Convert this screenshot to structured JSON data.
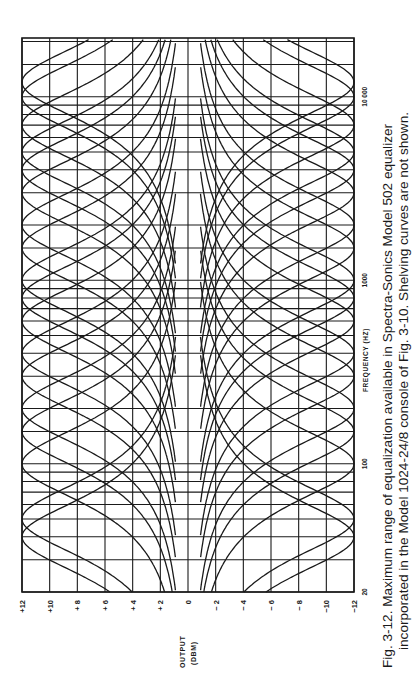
{
  "figure": {
    "caption_line1": "Fig. 3-12. Maximum range of equalization available in Spectra-Sonics Model 502 equalizer",
    "caption_line2": "incorporated in the Model 1024-24/8 console of Fig. 3-10. Shelving curves are not shown."
  },
  "colors": {
    "ink": "#1a1a1a",
    "paper": "#ffffff"
  },
  "chart_data": {
    "type": "line",
    "title": "Maximum range of equalization available in Spectra-Sonics Model 502 equalizer",
    "xlabel": "FREQUENCY (HZ)",
    "ylabel": "OUTPUT (DBM)",
    "ylabel_line1": "OUTPUT",
    "ylabel_line2": "(DBM)",
    "xscale": "log",
    "xlim": [
      20,
      20000
    ],
    "ylim": [
      -12,
      12
    ],
    "x_ticks": [
      20,
      100,
      1000,
      10000
    ],
    "x_tick_labels": [
      "20",
      "100",
      "1000",
      "10 000"
    ],
    "y_ticks": [
      12,
      10,
      8,
      6,
      4,
      2,
      0,
      -2,
      -4,
      -6,
      -8,
      -10,
      -12
    ],
    "y_tick_labels": [
      "+12",
      "+10",
      "+ 8",
      "+ 6",
      "+ 4",
      "+ 2",
      "0",
      "− 2",
      "− 4",
      "− 6",
      "− 8",
      "−10",
      "−12"
    ],
    "grid": true,
    "legend": "none",
    "orientation": "rotated 90° (frequency axis vertical, dB axis horizontal)",
    "series": [
      {
        "name": "boost/cut 40 Hz",
        "center_hz": 40,
        "peak_db": 12
      },
      {
        "name": "boost/cut 50 Hz",
        "center_hz": 50,
        "peak_db": 12
      },
      {
        "name": "boost/cut 100 Hz",
        "center_hz": 100,
        "peak_db": 12
      },
      {
        "name": "boost/cut 150 Hz",
        "center_hz": 150,
        "peak_db": 12
      },
      {
        "name": "boost/cut 200 Hz",
        "center_hz": 200,
        "peak_db": 12
      },
      {
        "name": "boost/cut 300 Hz",
        "center_hz": 300,
        "peak_db": 12
      },
      {
        "name": "boost/cut 400 Hz",
        "center_hz": 400,
        "peak_db": 12
      },
      {
        "name": "boost/cut 600 Hz",
        "center_hz": 600,
        "peak_db": 12
      },
      {
        "name": "boost/cut 800 Hz",
        "center_hz": 800,
        "peak_db": 12
      },
      {
        "name": "boost/cut 1000 Hz",
        "center_hz": 1000,
        "peak_db": 12
      },
      {
        "name": "boost/cut 1500 Hz",
        "center_hz": 1500,
        "peak_db": 12
      },
      {
        "name": "boost/cut 2000 Hz",
        "center_hz": 2000,
        "peak_db": 12
      },
      {
        "name": "boost/cut 3000 Hz",
        "center_hz": 3000,
        "peak_db": 12
      },
      {
        "name": "boost/cut 4000 Hz",
        "center_hz": 4000,
        "peak_db": 12
      },
      {
        "name": "boost/cut 5000 Hz",
        "center_hz": 5000,
        "peak_db": 12
      },
      {
        "name": "boost/cut 7000 Hz",
        "center_hz": 7000,
        "peak_db": 12
      },
      {
        "name": "boost/cut 10000 Hz",
        "center_hz": 10000,
        "peak_db": 12
      },
      {
        "name": "boost/cut 12000 Hz",
        "center_hz": 12000,
        "peak_db": 12
      }
    ],
    "freq_gridlines_hz": [
      20,
      30,
      40,
      50,
      60,
      70,
      80,
      90,
      100,
      150,
      200,
      300,
      400,
      500,
      600,
      700,
      800,
      900,
      1000,
      1500,
      2000,
      3000,
      4000,
      5000,
      6000,
      7000,
      8000,
      9000,
      10000,
      15000,
      20000
    ]
  }
}
